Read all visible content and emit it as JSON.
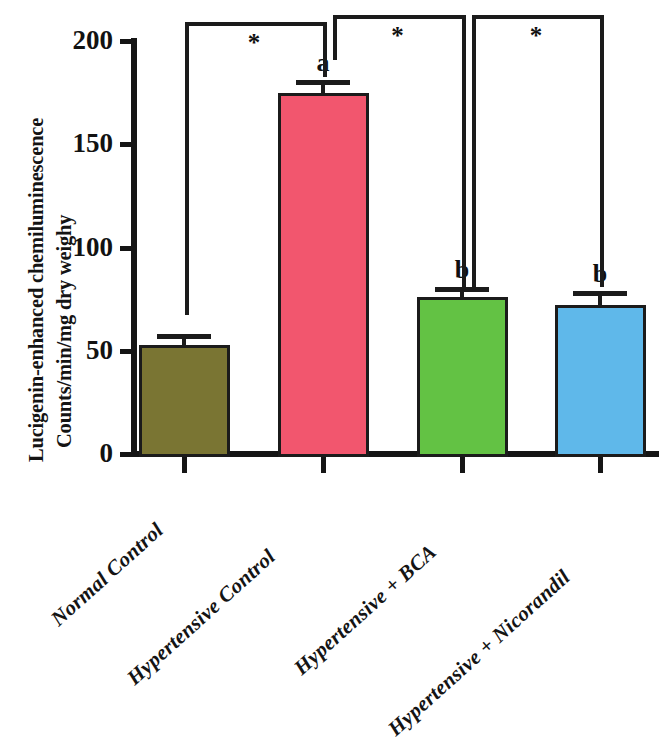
{
  "chart_data": {
    "type": "bar",
    "title": "",
    "subtitle": "",
    "xlabel": "",
    "ylabel_line1": "Lucigenin-enhanced chemiluminescence",
    "ylabel_line2": "Counts/min/mg dry weighy",
    "categories": [
      "Normal Control",
      "Hypertensive Control",
      "Hypertensive + BCA",
      "Hypertensive + Nicorandil"
    ],
    "values": [
      53,
      175,
      76,
      72
    ],
    "errors": [
      5,
      6,
      5,
      7
    ],
    "bar_colors": [
      "#7a7533",
      "#f2566e",
      "#63c244",
      "#5fb8ea"
    ],
    "bar_letters": [
      "",
      "a",
      "b",
      "b"
    ],
    "ylim": [
      0,
      200
    ],
    "yticks": [
      0,
      50,
      100,
      150,
      200
    ],
    "ytick_labels": [
      "0",
      "50",
      "100",
      "150",
      "200"
    ],
    "grid": false,
    "legend": "none",
    "significance": [
      {
        "from": 0,
        "to": 1,
        "label": "*"
      },
      {
        "from": 1,
        "to": 2,
        "label": "*"
      },
      {
        "from": 2,
        "to": 3,
        "label": "*"
      }
    ]
  }
}
